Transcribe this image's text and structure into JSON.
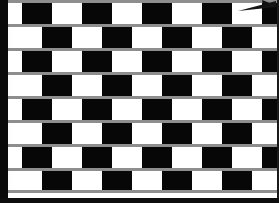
{
  "image": {
    "title": "Cafe Wall Illusion",
    "kind": "optical-illusion-figure",
    "width": 279,
    "height": 203
  },
  "colors": {
    "tile_dark": "#070707",
    "tile_light": "#ffffff",
    "mortar": "#8e8e8e",
    "background": "#fdfdfd",
    "frame": "#0a0a0a",
    "pointer": "#151515"
  },
  "geometry": {
    "field_left": 8,
    "field_top": 0,
    "field_width": 271,
    "field_height": 198,
    "tile_width": 30,
    "row_height": 24,
    "mortar_height": 3,
    "row_count": 8
  },
  "pattern": {
    "description": "Alternating black and white tiles in horizontal rows separated by thin grey mortar lines; each successive row is shifted horizontally producing the Cafe Wall illusion of sloping lines.",
    "rows": [
      {
        "index": 0,
        "top": 0,
        "height": 24,
        "offset": -16,
        "start_color": "white",
        "mortar_top": true
      },
      {
        "index": 1,
        "top": 24,
        "height": 24,
        "offset": 4,
        "start_color": "white",
        "mortar_top": true
      },
      {
        "index": 2,
        "top": 48,
        "height": 24,
        "offset": -16,
        "start_color": "white",
        "mortar_top": true
      },
      {
        "index": 3,
        "top": 72,
        "height": 24,
        "offset": 4,
        "start_color": "white",
        "mortar_top": true
      },
      {
        "index": 4,
        "top": 96,
        "height": 24,
        "offset": -16,
        "start_color": "white",
        "mortar_top": true
      },
      {
        "index": 5,
        "top": 120,
        "height": 24,
        "offset": 4,
        "start_color": "white",
        "mortar_top": true
      },
      {
        "index": 6,
        "top": 144,
        "height": 24,
        "offset": -16,
        "start_color": "white",
        "mortar_top": true
      },
      {
        "index": 7,
        "top": 168,
        "height": 22,
        "offset": 4,
        "start_color": "white",
        "mortar_top": true
      }
    ],
    "tiles_per_row": 11
  },
  "pointer": {
    "name": "cursor-arrow",
    "x": 232,
    "y": 0,
    "width": 44,
    "height": 14,
    "visible": true
  },
  "frame": {
    "left_band_width": 8,
    "bottom_band_height": 5,
    "right_band_width": 2
  }
}
